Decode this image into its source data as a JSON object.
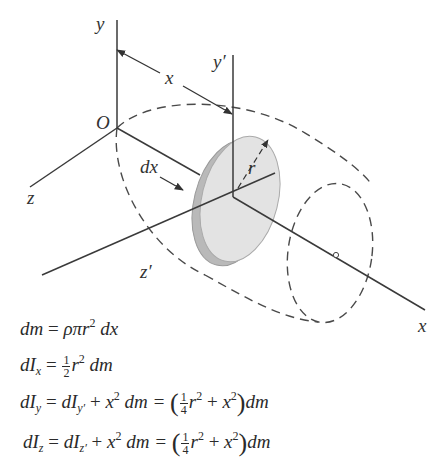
{
  "figure": {
    "labels": {
      "y_axis": "y",
      "y_prime_axis": "y′",
      "x_distance": "x",
      "origin": "O",
      "z_axis": "z",
      "dx": "dx",
      "radius": "r",
      "z_prime_axis": "z′",
      "x_axis": "x"
    },
    "colors": {
      "line": "#3a3a3a",
      "disk_face": "#e2e2e2",
      "disk_rim": "#b9b9b9",
      "dashed": "#4a4a4a"
    }
  },
  "equations": [
    {
      "lhs": "dm",
      "text": "dm = ρπr² dx"
    },
    {
      "lhs": "dI_x",
      "text": "dI_x = ½ r² dm"
    },
    {
      "lhs": "dI_y",
      "text": "dI_y = dI_y′ + x² dm = (¼ r² + x²) dm"
    },
    {
      "lhs": "dI_z",
      "text": "dI_z = dI_z′ + x² dm = (¼ r² + x²) dm"
    }
  ],
  "eq_parts": {
    "e1": {
      "a": "dm",
      "eq": " = ",
      "b": "ρπr",
      "exp": "2",
      "c": " dx"
    },
    "e2": {
      "a": "dI",
      "sub": "x",
      "eq": " = ",
      "num": "1",
      "den": "2",
      "b": "r",
      "exp": "2",
      "c": " dm"
    },
    "e3": {
      "a": "dI",
      "sub": "y",
      "eq": " = ",
      "b": "dI",
      "sub2": "y′",
      "plus": " + ",
      "x": "x",
      "exp": "2",
      "dm": " dm = ",
      "num": "1",
      "den": "4",
      "r": "r",
      "exp2": "2",
      "plus2": " + ",
      "x2": "x",
      "exp3": "2",
      "tail": "dm"
    },
    "e4": {
      "a": "dI",
      "sub": "z",
      "eq": " = ",
      "b": "dI",
      "sub2": "z′",
      "plus": " + ",
      "x": "x",
      "exp": "2",
      "dm": " dm = ",
      "num": "1",
      "den": "4",
      "r": "r",
      "exp2": "2",
      "plus2": " + ",
      "x2": "x",
      "exp3": "2",
      "tail": "dm"
    }
  }
}
